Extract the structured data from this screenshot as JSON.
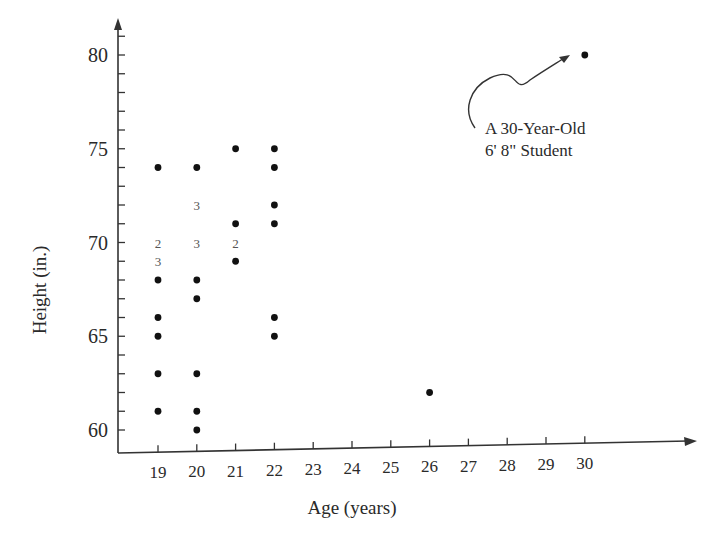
{
  "chart_data": {
    "type": "scatter",
    "title": "",
    "xlabel": "Age (years)",
    "ylabel": "Height (in.)",
    "xlim": [
      18,
      31
    ],
    "ylim": [
      59.5,
      81.5
    ],
    "grid": false,
    "legend": null,
    "x_ticks": [
      19,
      20,
      21,
      22,
      23,
      24,
      25,
      26,
      27,
      28,
      29,
      30
    ],
    "y_ticks": [
      60,
      65,
      70,
      75,
      80
    ],
    "y_minor_tick_step": 1,
    "points": [
      {
        "x": 19,
        "y": 74,
        "count": 1
      },
      {
        "x": 19,
        "y": 70,
        "count": 2
      },
      {
        "x": 19,
        "y": 69,
        "count": 3
      },
      {
        "x": 19,
        "y": 68,
        "count": 1
      },
      {
        "x": 19,
        "y": 66,
        "count": 1
      },
      {
        "x": 19,
        "y": 65,
        "count": 1
      },
      {
        "x": 19,
        "y": 63,
        "count": 1
      },
      {
        "x": 19,
        "y": 61,
        "count": 1
      },
      {
        "x": 20,
        "y": 74,
        "count": 1
      },
      {
        "x": 20,
        "y": 72,
        "count": 3
      },
      {
        "x": 20,
        "y": 70,
        "count": 3
      },
      {
        "x": 20,
        "y": 68,
        "count": 1
      },
      {
        "x": 20,
        "y": 67,
        "count": 1
      },
      {
        "x": 20,
        "y": 63,
        "count": 1
      },
      {
        "x": 20,
        "y": 61,
        "count": 1
      },
      {
        "x": 20,
        "y": 60,
        "count": 1
      },
      {
        "x": 21,
        "y": 75,
        "count": 1
      },
      {
        "x": 21,
        "y": 71,
        "count": 1
      },
      {
        "x": 21,
        "y": 70,
        "count": 2
      },
      {
        "x": 21,
        "y": 69,
        "count": 1
      },
      {
        "x": 22,
        "y": 75,
        "count": 1
      },
      {
        "x": 22,
        "y": 74,
        "count": 1
      },
      {
        "x": 22,
        "y": 72,
        "count": 1
      },
      {
        "x": 22,
        "y": 71,
        "count": 1
      },
      {
        "x": 22,
        "y": 66,
        "count": 1
      },
      {
        "x": 22,
        "y": 65,
        "count": 1
      },
      {
        "x": 26,
        "y": 62,
        "count": 1
      },
      {
        "x": 30,
        "y": 80,
        "count": 1
      }
    ],
    "annotations": [
      {
        "target": {
          "x": 30,
          "y": 80
        },
        "lines": [
          "A 30-Year-Old",
          "6' 8\" Student"
        ]
      }
    ],
    "count_label_note": "Numbers in place of dots indicate multiple students at that point"
  }
}
